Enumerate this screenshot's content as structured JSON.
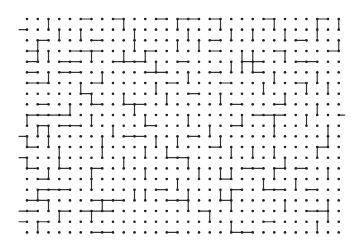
{
  "diagram": {
    "type": "dot-grid-maze",
    "grid": {
      "cols": 30,
      "rows": 21,
      "origin_x": 27,
      "origin_y": 19,
      "spacing_x": 10.75,
      "spacing_y": 10.67,
      "dot_radius": 1.3
    },
    "colors": {
      "background": "#ffffff",
      "dot": "#222222",
      "line": "#333333"
    },
    "horizontal_edges": [
      "00000100100010110100001000010",
      "00000000000000000000000000000",
      "01000010000000000100000001000",
      "10001110000100000100000100001",
      "10011000111000100000110001100",
      "10011000000110000100010000000",
      "11000010000001000010000001000",
      "00000100000000010000000000000",
      "01000010011000000001000100000",
      "11110000000000000000011100000",
      "01011000000100000001000000000",
      "00000000011000010000000000000",
      "10000000000000000100000000010",
      "00000000000001100000000000000",
      "10010010000000000000110101000",
      "01000000000000000010000000000",
      "01110000000010000001001100100",
      "11000011100001100010000000000",
      "10010111000000001000000000110",
      "01000000000000000000001000000",
      "00000011000001000001100000000"
    ],
    "vertical_edges": [
      "001000000100001000100001000101",
      "000101000010000100010100100100",
      "010000000010001010000000000001",
      "011000100101000000001100100000",
      "000000000000100000011100000000",
      "001000010000000100000001000100",
      "000001000000100000000010001010",
      "000000100100010000100000100000",
      "000010000010000000000000000100",
      "100000100001000100001001001000",
      "011000001000000001000001000010",
      "101000010000101000100000000010",
      "000100010001010000010101000100",
      "100100000100000100000000100000",
      "001000100001000010110001000010",
      "000000100000001000000010010000",
      "010000000011000100110000000000",
      "001000010000000100010000100010",
      "000100100000000001000000000010",
      "010000000000000000010000000100"
    ],
    "left_stubs_rows": [
      1,
      11,
      13,
      18,
      19
    ],
    "right_stubs_rows": [
      9
    ]
  }
}
